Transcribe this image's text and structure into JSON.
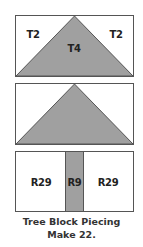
{
  "colors": {
    "fill_gray": "#a0a0a0",
    "outline": "#555555",
    "background": "#ffffff"
  },
  "blocks": {
    "top": {
      "labels": {
        "left": "T2",
        "center": "T4",
        "right": "T2"
      }
    },
    "middle": {
      "labels": {}
    },
    "bottom": {
      "labels": {
        "left": "R29",
        "center": "R9",
        "right": "R29"
      }
    }
  },
  "caption": {
    "line1": "Tree Block Piecing",
    "line2": "Make 22."
  }
}
